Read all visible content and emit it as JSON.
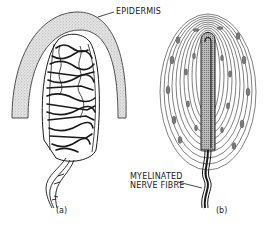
{
  "figure": {
    "panels": [
      {
        "id": "a",
        "label": "(a)",
        "annotation": "EPIDERMIS"
      },
      {
        "id": "b",
        "label": "(b)",
        "annotation_lines": [
          "MYELINATED",
          "NERVE FIBRE"
        ]
      }
    ],
    "colors": {
      "ink": "#1a1a1a",
      "stipple": "#9a9a9a",
      "background": "#ffffff"
    }
  }
}
